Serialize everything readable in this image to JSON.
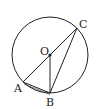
{
  "diagram": {
    "type": "geometry-circle",
    "circle": {
      "center_label": "O",
      "cx": 50,
      "cy": 55,
      "r": 38
    },
    "points": {
      "O": {
        "label": "O",
        "x": 50,
        "y": 55
      },
      "A": {
        "label": "A",
        "x": 23,
        "y": 82
      },
      "B": {
        "label": "B",
        "x": 50,
        "y": 93
      },
      "C": {
        "label": "C",
        "x": 77,
        "y": 28
      }
    },
    "segments": [
      [
        "A",
        "C"
      ],
      [
        "O",
        "B"
      ],
      [
        "B",
        "C"
      ],
      [
        "A",
        "B"
      ]
    ],
    "colors": {
      "stroke": "#222222",
      "background": "#ffffff"
    }
  }
}
